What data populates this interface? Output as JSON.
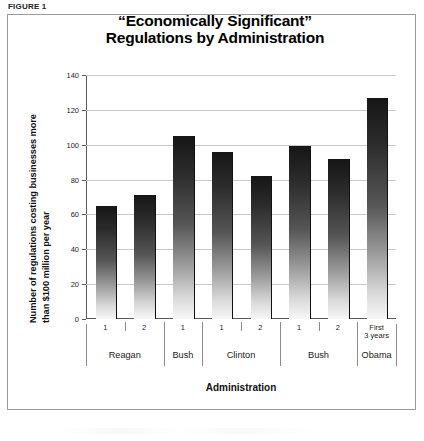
{
  "figure": {
    "label": "FIGURE 1",
    "title_line1": "“Economically Significant”",
    "title_line2": "Regulations by Administration"
  },
  "chart_data": {
    "type": "bar",
    "title": "“Economically Significant” Regulations by Administration",
    "xlabel": "Administration",
    "ylabel_line1": "Number of regulations costing businesses more",
    "ylabel_line2": "than $100 million per year",
    "ylim": [
      0,
      140
    ],
    "ytick_labels": [
      "0",
      "20",
      "40",
      "60",
      "80",
      "100",
      "120",
      "140"
    ],
    "ytick_values": [
      0,
      20,
      40,
      60,
      80,
      100,
      120,
      140
    ],
    "grid": true,
    "legend": "none",
    "categories": [
      "Reagan 1",
      "Reagan 2",
      "Bush 1",
      "Clinton 1",
      "Clinton 2",
      "Bush 1",
      "Bush 2",
      "Obama First 3 years"
    ],
    "term_labels": [
      "1",
      "2",
      "1",
      "1",
      "2",
      "1",
      "2",
      "First\n3 years"
    ],
    "values": [
      65,
      71,
      105,
      96,
      82,
      99,
      92,
      127
    ],
    "groups": [
      {
        "name": "Reagan",
        "terms": 2
      },
      {
        "name": "Bush",
        "terms": 1
      },
      {
        "name": "Clinton",
        "terms": 2
      },
      {
        "name": "Bush",
        "terms": 2
      },
      {
        "name": "Obama",
        "terms": 1
      }
    ],
    "bar_color_top": "#161616",
    "bar_color_bottom": "#f7f7f7",
    "axis_color": "#5a5a5a",
    "grid_color": "#c9c9c9"
  }
}
